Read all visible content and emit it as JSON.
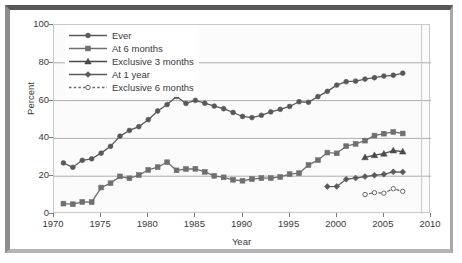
{
  "chart_data": {
    "type": "line",
    "title": "",
    "xlabel": "Year",
    "ylabel": "Percent",
    "xlim": [
      1970,
      2010
    ],
    "ylim": [
      0,
      100
    ],
    "xticks": [
      1970,
      1975,
      1980,
      1985,
      1990,
      1995,
      2000,
      2005,
      2010
    ],
    "yticks": [
      0,
      20,
      40,
      60,
      80,
      100
    ],
    "grid": "horizontal",
    "legend_position": "top-left",
    "series": [
      {
        "name": "Ever",
        "marker": "circle",
        "linestyle": "solid",
        "color": "#58585a",
        "x": [
          1971,
          1972,
          1973,
          1974,
          1975,
          1976,
          1977,
          1978,
          1979,
          1980,
          1981,
          1982,
          1983,
          1984,
          1985,
          1986,
          1987,
          1988,
          1989,
          1990,
          1991,
          1992,
          1993,
          1994,
          1995,
          1996,
          1997,
          1998,
          1999,
          2000,
          2001,
          2002,
          2003,
          2004,
          2005,
          2006,
          2007
        ],
        "values": [
          27.0,
          24.7,
          28.4,
          29.2,
          32.2,
          35.8,
          41.2,
          44.2,
          46.2,
          49.9,
          54.5,
          57.9,
          62.2,
          58.5,
          60.1,
          58.6,
          57.1,
          55.7,
          53.7,
          51.6,
          51.0,
          52.2,
          54.0,
          55.4,
          56.9,
          59.4,
          59.1,
          62.1,
          64.9,
          68.2,
          70.0,
          70.3,
          71.4,
          72.1,
          73.0,
          73.4,
          74.5
        ],
        "note": "Ever breastfed"
      },
      {
        "name": "At 6 months",
        "marker": "square",
        "linestyle": "solid",
        "color": "#6f6f72",
        "x": [
          1971,
          1972,
          1973,
          1974,
          1975,
          1976,
          1977,
          1978,
          1979,
          1980,
          1981,
          1982,
          1983,
          1984,
          1985,
          1986,
          1987,
          1988,
          1989,
          1990,
          1991,
          1992,
          1993,
          1994,
          1995,
          1996,
          1997,
          1998,
          1999,
          2000,
          2001,
          2002,
          2003,
          2004,
          2005,
          2006,
          2007
        ],
        "values": [
          5.5,
          5.2,
          6.4,
          6.3,
          14.0,
          16.3,
          19.9,
          18.9,
          20.6,
          23.3,
          24.8,
          27.4,
          23.1,
          23.8,
          23.9,
          22.3,
          20.2,
          19.4,
          18.1,
          17.6,
          18.5,
          19.0,
          19.0,
          19.6,
          21.1,
          21.6,
          25.9,
          28.5,
          32.5,
          32.1,
          35.9,
          37.1,
          38.8,
          41.5,
          42.5,
          43.4,
          42.6
        ],
        "note": "Breastfeeding at 6 months"
      },
      {
        "name": "Exclusive 3 months",
        "marker": "triangle",
        "linestyle": "solid",
        "color": "#4a4a4c",
        "x": [
          2003,
          2004,
          2005,
          2006,
          2007
        ],
        "values": [
          30.0,
          31.1,
          31.9,
          33.6,
          33.0
        ],
        "note": "Exclusive breastfeeding through 3 months"
      },
      {
        "name": "At 1 year",
        "marker": "diamond",
        "linestyle": "solid",
        "color": "#5a5a5c",
        "x": [
          1999,
          2000,
          2001,
          2002,
          2003,
          2004,
          2005,
          2006,
          2007
        ],
        "values": [
          14.5,
          14.6,
          18.4,
          19.0,
          19.8,
          20.5,
          21.0,
          22.3,
          22.2
        ],
        "note": "Breastfeeding at 1 year"
      },
      {
        "name": "Exclusive 6 months",
        "marker": "open-circle",
        "linestyle": "dashed",
        "color": "#6a6a6c",
        "x": [
          2003,
          2004,
          2005,
          2006,
          2007
        ],
        "values": [
          10.3,
          11.3,
          11.0,
          13.4,
          12.0
        ],
        "note": "Exclusive breastfeeding through 6 months"
      }
    ],
    "legend_entries": [
      {
        "label": "Ever",
        "marker": "circle",
        "linestyle": "solid"
      },
      {
        "label": "At 6 months",
        "marker": "square",
        "linestyle": "solid"
      },
      {
        "label": "Exclusive 3 months",
        "marker": "triangle",
        "linestyle": "solid"
      },
      {
        "label": "At 1 year",
        "marker": "diamond",
        "linestyle": "solid"
      },
      {
        "label": "Exclusive 6 months",
        "marker": "open-circle",
        "linestyle": "dashed"
      }
    ],
    "annotations": [
      {
        "type": "vertical-line",
        "x": 2009,
        "color": "#c9c9cc"
      }
    ]
  },
  "colors": {
    "plot_background": "#fbfbfb",
    "grid": "#9a9a9d",
    "axis": "#7a7a7d",
    "text": "#3a3a3c",
    "frame_dark": "#58585a",
    "frame_light": "#b5b5b8"
  },
  "axis": {
    "y_title": "Percent",
    "x_title": "Year",
    "y_tick_labels": [
      "0",
      "20",
      "40",
      "60",
      "80",
      "100"
    ],
    "x_tick_labels": [
      "1970",
      "1975",
      "1980",
      "1985",
      "1990",
      "1995",
      "2000",
      "2005",
      "2010"
    ]
  }
}
